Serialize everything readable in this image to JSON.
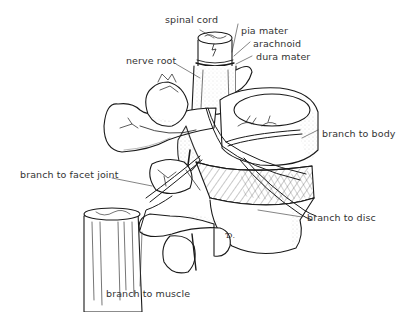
{
  "diagram": {
    "labels": {
      "spinal_cord": "spinal cord",
      "pia_mater": "pia mater",
      "arachnoid": "arachnoid",
      "dura_mater": "dura mater",
      "nerve_root": "nerve root",
      "branch_to_body": "branch to body",
      "branch_to_facet_joint": "branch to facet joint",
      "branch_to_disc": "branch to disc",
      "branch_to_muscle": "branch to muscle"
    },
    "artist_signature": "Ɗ.",
    "colors": {
      "ink": "#1a1a1a",
      "label_text": "#333333",
      "background": "#ffffff",
      "stipple": "#9a9a9a"
    }
  }
}
